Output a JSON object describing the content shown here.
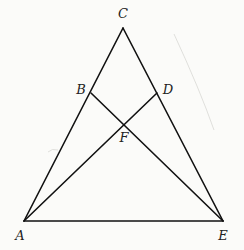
{
  "figure": {
    "width": 244,
    "height": 250,
    "line_color": "#111111",
    "background": "#fbfbf9",
    "points": {
      "A": {
        "x": 24,
        "y": 221,
        "label": "A",
        "lx": 20,
        "ly": 240
      },
      "C": {
        "x": 123,
        "y": 28,
        "label": "C",
        "lx": 123,
        "ly": 18
      },
      "E": {
        "x": 223,
        "y": 221,
        "label": "E",
        "lx": 223,
        "ly": 240
      },
      "B": {
        "x": 91,
        "y": 93,
        "label": "B",
        "lx": 81,
        "ly": 94
      },
      "D": {
        "x": 157,
        "y": 93,
        "label": "D",
        "lx": 168,
        "ly": 94
      },
      "F": {
        "x": 124,
        "y": 125,
        "label": "F",
        "lx": 124,
        "ly": 142
      }
    },
    "segments": [
      [
        "A",
        "C"
      ],
      [
        "C",
        "E"
      ],
      [
        "A",
        "E"
      ],
      [
        "B",
        "E"
      ],
      [
        "A",
        "D"
      ]
    ]
  }
}
